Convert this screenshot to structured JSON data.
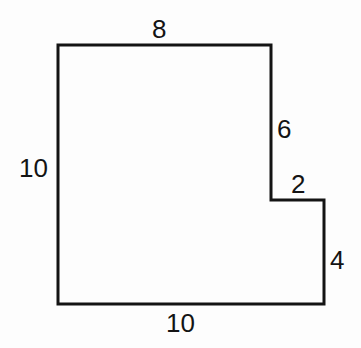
{
  "diagram": {
    "type": "rectilinear-polygon",
    "stroke_color": "#141414",
    "background_color": "#fdfdfd",
    "vertices_px": [
      [
        58,
        45
      ],
      [
        271,
        45
      ],
      [
        271,
        200
      ],
      [
        324,
        200
      ],
      [
        324,
        304
      ],
      [
        58,
        304
      ]
    ],
    "labels": {
      "top": "8",
      "left": "10",
      "right_upper": "6",
      "notch": "2",
      "right_lower": "4",
      "bottom": "10"
    }
  }
}
